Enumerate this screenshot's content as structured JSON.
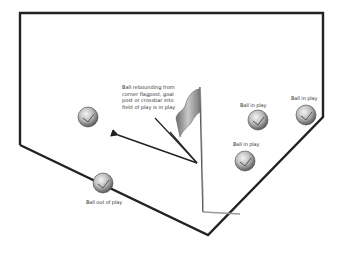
{
  "diagram": {
    "type": "soccer-rule-illustration",
    "annotation": "Ball rebounding from corner flagpost, goal post or crossbar into field of play is in play",
    "balls": [
      {
        "id": "ball-left",
        "label": ""
      },
      {
        "id": "ball-center",
        "label": "Ball in play"
      },
      {
        "id": "ball-right",
        "label": "Ball in play"
      },
      {
        "id": "ball-lower",
        "label": "Ball in play"
      },
      {
        "id": "ball-out",
        "label": "Ball out of play"
      }
    ]
  },
  "colors": {
    "line": "#222222",
    "flag": "#8a8a8a",
    "ball": "#b8b8b8"
  }
}
